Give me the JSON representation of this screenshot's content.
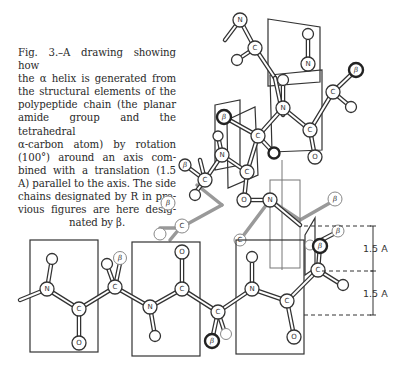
{
  "figure": {
    "caption_lines": [
      "Fig. 3.–A drawing showing how",
      "the α helix is generated from",
      "the structural elements of the",
      "polypeptide chain (the planar",
      "amide group and the tetrahedral",
      "α-carbon atom) by rotation",
      "(100°) around an axis com-",
      "bined with a translation (1.5",
      "A) parallel to the axis. The side",
      "chains designated by R in pre-",
      "vious figures are here desig-"
    ],
    "caption_last_line": "nated by β.",
    "dimension_labels": [
      "1.5 A",
      "1.5 A"
    ],
    "atom_labels": {
      "nitrogen": "N",
      "carbon": "C",
      "oxygen": "O",
      "side_chain": "β"
    }
  }
}
